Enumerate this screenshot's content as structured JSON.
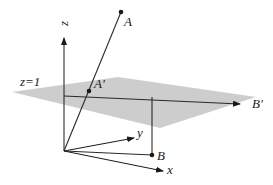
{
  "figure": {
    "type": "3d-projection-diagram"
  },
  "plane": {
    "label": "z=1",
    "fill_color": "#c8c8c8"
  },
  "axes": {
    "x_label": "x",
    "y_label": "y",
    "z_label": "z"
  },
  "points": {
    "A": "A",
    "A_prime": "A'",
    "B": "B",
    "B_prime": "B'"
  },
  "colors": {
    "line": "#1a1a1a",
    "plane": "#c8c8c8",
    "background": "#ffffff"
  }
}
